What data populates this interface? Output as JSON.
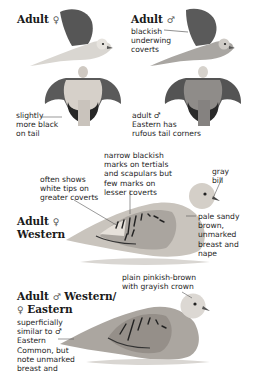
{
  "plates": {
    "top_left": {
      "title": "Adult",
      "sex_symbol": "♀",
      "note_lines": [
        "slightly",
        "more black",
        "on tail"
      ]
    },
    "top_right": {
      "title": "Adult",
      "sex_symbol": "♂",
      "note_top_lines": [
        "blackish",
        "underwing",
        "coverts"
      ],
      "note_bottom_lines": [
        "adult ♂",
        "Eastern has",
        "rufous tail corners"
      ]
    },
    "middle": {
      "title_line1": "Adult",
      "title_sex": "♀",
      "title_line2": "Western",
      "note_marks_lines": [
        "narrow blackish",
        "marks on tertials",
        "and scapulars but",
        "few marks on",
        "lesser coverts"
      ],
      "note_tips_lines": [
        "often shows",
        "white tips on",
        "greater coverts"
      ],
      "note_bill_lines": [
        "gray",
        "bill"
      ],
      "note_breast_lines": [
        "pale sandy",
        "brown,",
        "unmarked",
        "breast and",
        "nape"
      ]
    },
    "bottom": {
      "title_line1_a": "Adult",
      "title_line1_sex": "♂",
      "title_line1_b": "Western/",
      "title_line2_sex": "♀",
      "title_line2_b": "Eastern",
      "note_crown_lines": [
        "plain pinkish-brown",
        "with grayish crown"
      ],
      "note_similar_lines": [
        "superficially",
        "similar to ♂",
        "Eastern",
        "Common, but",
        "note unmarked",
        "breast and"
      ]
    }
  },
  "colors": {
    "background": "#ffffff",
    "text": "#1e1e1e",
    "wing_dark": "#4a4a4a",
    "body_pale": "#d8d4cf",
    "body_gray": "#9c9a98",
    "marks": "#222222"
  }
}
